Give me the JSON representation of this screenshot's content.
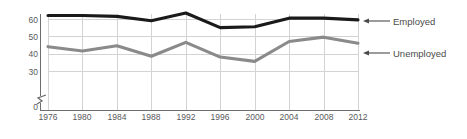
{
  "chart_data": {
    "type": "line",
    "title": "",
    "subtitle": "",
    "xlabel": "",
    "ylabel": "",
    "x": [
      1976,
      1980,
      1984,
      1988,
      1992,
      1996,
      2000,
      2004,
      2008,
      2012
    ],
    "xtick_labels": [
      "1976",
      "1980",
      "1984",
      "1988",
      "1992",
      "1996",
      "2000",
      "2004",
      "2008",
      "2012"
    ],
    "ytick_labels": [
      "0",
      "30",
      "40",
      "50",
      "60"
    ],
    "yticks": [
      0,
      30,
      40,
      50,
      60
    ],
    "ylim": [
      30,
      65
    ],
    "y_axis_break": true,
    "grid": "both",
    "legend_position": "right-inline-annotations",
    "series": [
      {
        "name": "Employed",
        "color": "#1a1a1a",
        "values": [
          62.0,
          62.0,
          61.5,
          59.0,
          63.5,
          55.0,
          55.5,
          60.5,
          60.5,
          59.5
        ]
      },
      {
        "name": "Unemployed",
        "color": "#8a8a8a",
        "values": [
          44.0,
          41.5,
          44.5,
          38.5,
          46.5,
          38.0,
          35.5,
          47.0,
          49.5,
          46.0
        ]
      }
    ],
    "annotations": [
      {
        "text": "Employed",
        "points_to_series": "Employed"
      },
      {
        "text": "Unemployed",
        "points_to_series": "Unemployed"
      }
    ]
  },
  "colors": {
    "employed_line": "#1a1a1a",
    "unemployed_line": "#8a8a8a",
    "gridline": "#d3d3d3",
    "axis": "#6d6d6d",
    "tick_text": "#58595b",
    "callout_text": "#4b4b4b",
    "background": "#ffffff"
  },
  "axis": {
    "y_labels": [
      "60",
      "50",
      "40",
      "30",
      "0"
    ],
    "x_labels": [
      "1976",
      "1980",
      "1984",
      "1988",
      "1992",
      "1996",
      "2000",
      "2004",
      "2008",
      "2012"
    ]
  },
  "callouts": {
    "employed": "Employed",
    "unemployed": "Unemployed"
  }
}
